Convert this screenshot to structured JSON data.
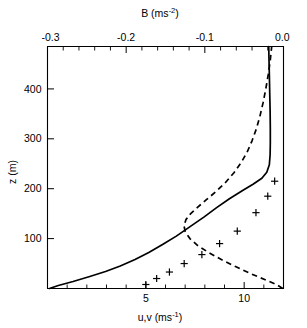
{
  "figure": {
    "background_color": "#ffffff",
    "line_color": "#000000"
  },
  "chart_data": {
    "type": "line",
    "title": "",
    "subtitle": "",
    "grid": false,
    "legend": "none",
    "top_axis": {
      "label_text": "B (ms",
      "label_exponent": "-2",
      "label_tail": ")",
      "label_full": "B (ms^-2)",
      "variable": "B",
      "units": "ms^-2",
      "min": -0.3,
      "max": 0.0,
      "major_ticks": [
        -0.3,
        -0.2,
        -0.1,
        0.0
      ],
      "major_tick_labels": [
        "-0.3",
        "-0.2",
        "-0.1",
        "0.0"
      ],
      "minor_tick_step": 0.02,
      "position": "top"
    },
    "bottom_axis": {
      "label_text": "u,v (ms",
      "label_exponent": "-1",
      "label_tail": ")",
      "label_full": "u,v (ms^-1)",
      "variable": "u,v",
      "units": "ms^-1",
      "min": 0.0,
      "max": 12.0,
      "major_ticks": [
        5,
        10
      ],
      "major_tick_labels": [
        "5",
        "10"
      ],
      "minor_tick_step": 1,
      "position": "bottom"
    },
    "y_axis": {
      "label_text": "z (m)",
      "variable": "z",
      "units": "m",
      "min": 0,
      "max": 485,
      "major_ticks": [
        100,
        200,
        300,
        400
      ],
      "major_tick_labels": [
        "100",
        "200",
        "300",
        "400"
      ],
      "position": "left"
    },
    "series": [
      {
        "name": "u wind speed profile",
        "style": "solid",
        "axis": "bottom",
        "points": [
          [
            0.1,
            0
          ],
          [
            0.55,
            6
          ],
          [
            1.3,
            14
          ],
          [
            2.15,
            24
          ],
          [
            2.95,
            34
          ],
          [
            3.7,
            45
          ],
          [
            4.45,
            58
          ],
          [
            5.15,
            72
          ],
          [
            5.85,
            88
          ],
          [
            6.55,
            105
          ],
          [
            7.25,
            124
          ],
          [
            7.95,
            143
          ],
          [
            8.6,
            162
          ],
          [
            9.25,
            180
          ],
          [
            9.9,
            196
          ],
          [
            10.45,
            209
          ],
          [
            10.9,
            221
          ],
          [
            11.15,
            233
          ],
          [
            11.28,
            248
          ],
          [
            11.32,
            268
          ],
          [
            11.33,
            292
          ],
          [
            11.33,
            320
          ],
          [
            11.32,
            355
          ],
          [
            11.3,
            392
          ],
          [
            11.28,
            430
          ],
          [
            11.26,
            463
          ],
          [
            11.25,
            485
          ]
        ]
      },
      {
        "name": "B buoyancy profile",
        "style": "dashed",
        "axis": "top",
        "points": [
          [
            -0.001,
            0
          ],
          [
            -0.009,
            8
          ],
          [
            -0.024,
            18
          ],
          [
            -0.042,
            30
          ],
          [
            -0.061,
            44
          ],
          [
            -0.079,
            58
          ],
          [
            -0.095,
            72
          ],
          [
            -0.109,
            86
          ],
          [
            -0.119,
            100
          ],
          [
            -0.125,
            114
          ],
          [
            -0.1265,
            126
          ],
          [
            -0.124,
            138
          ],
          [
            -0.118,
            150
          ],
          [
            -0.109,
            163
          ],
          [
            -0.098,
            178
          ],
          [
            -0.086,
            194
          ],
          [
            -0.074,
            212
          ],
          [
            -0.063,
            232
          ],
          [
            -0.054,
            252
          ],
          [
            -0.046,
            274
          ],
          [
            -0.04,
            296
          ],
          [
            -0.0345,
            320
          ],
          [
            -0.03,
            345
          ],
          [
            -0.026,
            372
          ],
          [
            -0.0225,
            400
          ],
          [
            -0.0195,
            428
          ],
          [
            -0.017,
            455
          ],
          [
            -0.015,
            485
          ]
        ]
      }
    ],
    "markers": {
      "name": "observed u,v data points",
      "symbol": "+",
      "axis": "bottom",
      "points": [
        [
          5.0,
          8
        ],
        [
          5.55,
          20
        ],
        [
          6.2,
          33
        ],
        [
          6.95,
          50
        ],
        [
          7.85,
          68
        ],
        [
          8.75,
          90
        ],
        [
          9.65,
          115
        ],
        [
          10.6,
          152
        ],
        [
          11.2,
          185
        ],
        [
          11.55,
          215
        ]
      ]
    }
  }
}
